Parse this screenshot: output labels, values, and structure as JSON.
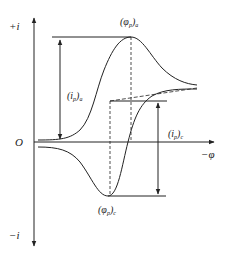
{
  "diagram": {
    "axes": {
      "y_positive_label": "+i",
      "y_negative_label": "−i",
      "origin_label": "O",
      "x_label": "−φ"
    },
    "annotations": {
      "anodic_peak_potential": {
        "main": "(φ",
        "sub": "p",
        "close": ")",
        "tail": "a"
      },
      "anodic_peak_current": {
        "main": "(i",
        "sub": "p",
        "close": ")",
        "tail": "a"
      },
      "cathodic_peak_current": {
        "main": "(i",
        "sub": "p",
        "close": ")",
        "tail": "c"
      },
      "cathodic_peak_potential": {
        "main": "(φ",
        "sub": "p",
        "close": ")",
        "tail": "c"
      }
    },
    "colors": {
      "line": "#222222",
      "background": "#ffffff"
    }
  }
}
